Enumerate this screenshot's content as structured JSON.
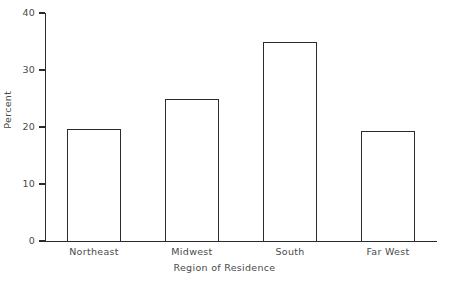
{
  "chart_data": {
    "type": "bar",
    "title": "",
    "subtitle": "",
    "xlabel": "Region of Residence",
    "ylabel": "Percent",
    "categories": [
      "Northeast",
      "Midwest",
      "South",
      "Far West"
    ],
    "values": [
      19.6,
      25.0,
      35.0,
      19.3
    ],
    "ylim": [
      0,
      40
    ],
    "yticks": [
      0,
      10,
      20,
      30,
      40
    ],
    "ytick_labels": [
      "0",
      "10",
      "20",
      "30",
      "40"
    ],
    "grid": false,
    "legend": null,
    "legend_position": "none",
    "annotations": [],
    "style": {
      "bar_fill": "#ffffff",
      "bar_edge": "#2b2b2b",
      "axis_color": "#2b2b2b",
      "text_color": "#4a4a4a",
      "background": "#ffffff"
    }
  }
}
